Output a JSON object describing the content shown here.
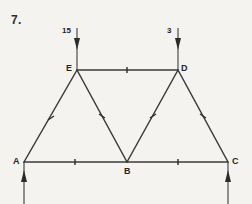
{
  "figure": {
    "number_label": "7.",
    "type": "truss-free-body-diagram",
    "colors": {
      "background": "#f5f3ef",
      "line": "#3b3b3b",
      "text": "#262626"
    },
    "nodes": [
      {
        "id": "A",
        "label": "A",
        "x": 24,
        "y": 162
      },
      {
        "id": "B",
        "label": "B",
        "x": 127,
        "y": 162
      },
      {
        "id": "C",
        "label": "C",
        "x": 228,
        "y": 162
      },
      {
        "id": "D",
        "label": "D",
        "x": 178,
        "y": 70
      },
      {
        "id": "E",
        "label": "E",
        "x": 77,
        "y": 70
      }
    ],
    "members": [
      {
        "from": "A",
        "to": "B",
        "name": "member-ab"
      },
      {
        "from": "B",
        "to": "C",
        "name": "member-bc"
      },
      {
        "from": "E",
        "to": "D",
        "name": "member-ed"
      },
      {
        "from": "A",
        "to": "E",
        "name": "member-ae"
      },
      {
        "from": "E",
        "to": "B",
        "name": "member-eb"
      },
      {
        "from": "B",
        "to": "D",
        "name": "member-bd"
      },
      {
        "from": "D",
        "to": "C",
        "name": "member-dc"
      }
    ],
    "loads": [
      {
        "at": "E",
        "label": "15",
        "direction": "down",
        "label_x": 62,
        "label_y": 27
      },
      {
        "at": "D",
        "label": "3",
        "direction": "down",
        "label_x": 166,
        "label_y": 27
      }
    ],
    "reactions": [
      {
        "at": "A",
        "label": "",
        "direction": "up"
      },
      {
        "at": "C",
        "label": "",
        "direction": "up"
      }
    ]
  }
}
